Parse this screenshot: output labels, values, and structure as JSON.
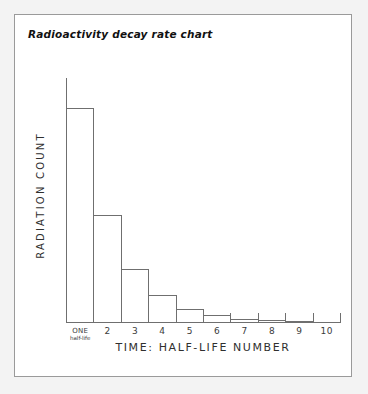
{
  "frame": {
    "border_color": "#9a9a9a",
    "background": "#ffffff",
    "page_background": "#f3f3f3"
  },
  "title": "Radioactivity decay rate chart",
  "chart_data": {
    "type": "bar",
    "title": "Radioactivity decay rate chart",
    "xlabel": "TIME: HALF-LIFE NUMBER",
    "ylabel": "RADIATION COUNT",
    "categories": [
      "ONE",
      "2",
      "3",
      "4",
      "5",
      "6",
      "7",
      "8",
      "9",
      "10"
    ],
    "first_tick_sublabel": "half-life",
    "values": [
      100,
      50,
      25,
      12.5,
      6.25,
      3.13,
      1.56,
      0.78,
      0.39,
      0.2
    ],
    "ylim": [
      0,
      114
    ],
    "grid": false,
    "legend": null,
    "bar_style": "outline",
    "bar_stroke": "#6f6f6f",
    "axis_color": "#6f6f6f",
    "note": "Exponential halving: each successive half-life reduces the radiation count to one half of the previous value."
  },
  "axis": {
    "x_title": "TIME: HALF-LIFE NUMBER",
    "y_title": "RADIATION COUNT"
  }
}
